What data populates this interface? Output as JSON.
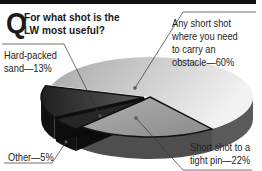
{
  "header": {
    "q_initial": "Q",
    "question": "For what shot is the LW most useful?"
  },
  "chart_data": {
    "type": "pie",
    "style": "3d",
    "title": "For what shot is the LW most useful?",
    "slices": [
      {
        "label": "Any short shot where you need to carry an obstacle",
        "value": 60,
        "display": "Any short shot where you need to carry an obstacle—60%",
        "color": "#c8c8c8"
      },
      {
        "label": "Short shot to a tight pin",
        "value": 22,
        "display": "Short shot to a tight pin—22%",
        "color": "#9a9a9a"
      },
      {
        "label": "Other",
        "value": 5,
        "display": "Other—5%",
        "color": "#1e1e1e"
      },
      {
        "label": "Hard-packed sand",
        "value": 13,
        "display": "Hard-packed sand—13%",
        "color": "#3a3a3a"
      }
    ],
    "labels": {
      "obstacle": [
        "Any short shot",
        "where you need",
        "to carry an",
        "obstacle—60%"
      ],
      "sand": [
        "Hard-packed",
        "sand—13%"
      ],
      "other": [
        "Other—5%"
      ],
      "pin": [
        "Short shot to a",
        "tight pin—22%"
      ]
    },
    "legend": "none (callout labels)"
  }
}
